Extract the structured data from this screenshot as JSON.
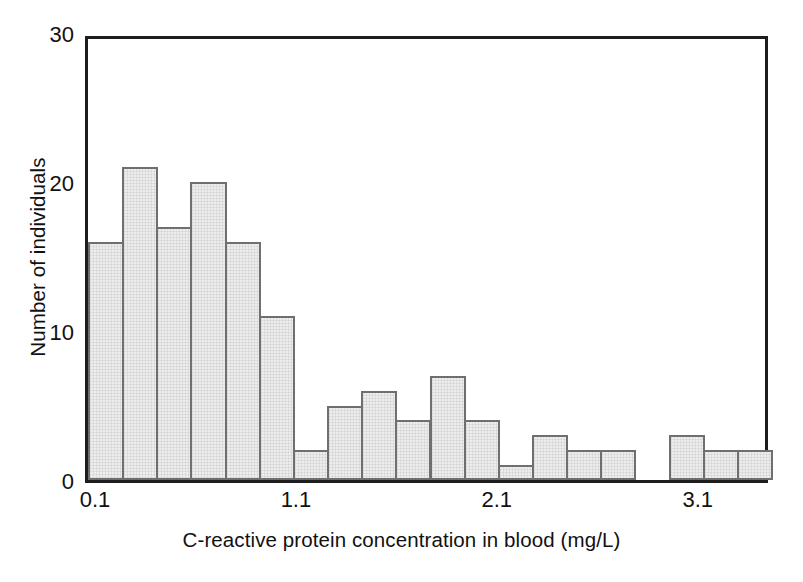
{
  "chart_data": {
    "type": "bar",
    "title": "",
    "subtitle": "",
    "xlabel": "C-reactive protein concentration in blood (mg/L)",
    "ylabel": "Number of individuals",
    "xlim": [
      0.05,
      3.45
    ],
    "ylim": [
      0,
      30
    ],
    "grid": false,
    "legend": null,
    "bin_width": 0.17,
    "x_tick_labels": [
      "0.1",
      "1.1",
      "2.1",
      "3.1"
    ],
    "x_tick_values": [
      0.1,
      1.1,
      2.1,
      3.1
    ],
    "y_tick_labels": [
      "0",
      "10",
      "20",
      "30"
    ],
    "y_tick_values": [
      0,
      10,
      20,
      30
    ],
    "categories": [
      "bin-1",
      "bin-2",
      "bin-3",
      "bin-4",
      "bin-5",
      "bin-6",
      "bin-7",
      "bin-8",
      "bin-9",
      "bin-10",
      "bin-11",
      "bin-12",
      "bin-13",
      "bin-14",
      "bin-15",
      "bin-16",
      "bin-17",
      "bin-18",
      "bin-19",
      "bin-20"
    ],
    "values": [
      16,
      21,
      17,
      20,
      16,
      11,
      2,
      5,
      6,
      4,
      7,
      4,
      1,
      3,
      2,
      2,
      0,
      3,
      2,
      2
    ],
    "colors": {
      "bar_fill": "#ededed",
      "bar_stroke": "#6f6f6f",
      "axis": "#1d1d1d",
      "text": "#111111",
      "background": "#ffffff"
    }
  },
  "axes": {
    "y": {
      "title": "Number of individuals",
      "ticks": [
        {
          "label": "30",
          "value": 30
        },
        {
          "label": "20",
          "value": 20
        },
        {
          "label": "10",
          "value": 10
        },
        {
          "label": "0",
          "value": 0
        }
      ]
    },
    "x": {
      "title": "C-reactive protein concentration in blood (mg/L)",
      "ticks": [
        {
          "label": "0.1",
          "value": 0.1
        },
        {
          "label": "1.1",
          "value": 1.1
        },
        {
          "label": "2.1",
          "value": 2.1
        },
        {
          "label": "3.1",
          "value": 3.1
        }
      ]
    }
  }
}
